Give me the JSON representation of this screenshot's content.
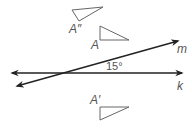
{
  "diagram": {
    "lines": [
      {
        "name": "m",
        "label": "m"
      },
      {
        "name": "k",
        "label": "k"
      }
    ],
    "angle_label": "15°",
    "triangles": [
      {
        "name": "A-double-prime",
        "label": "A″"
      },
      {
        "name": "A",
        "label": "A"
      },
      {
        "name": "A-prime",
        "label": "A′"
      }
    ]
  }
}
